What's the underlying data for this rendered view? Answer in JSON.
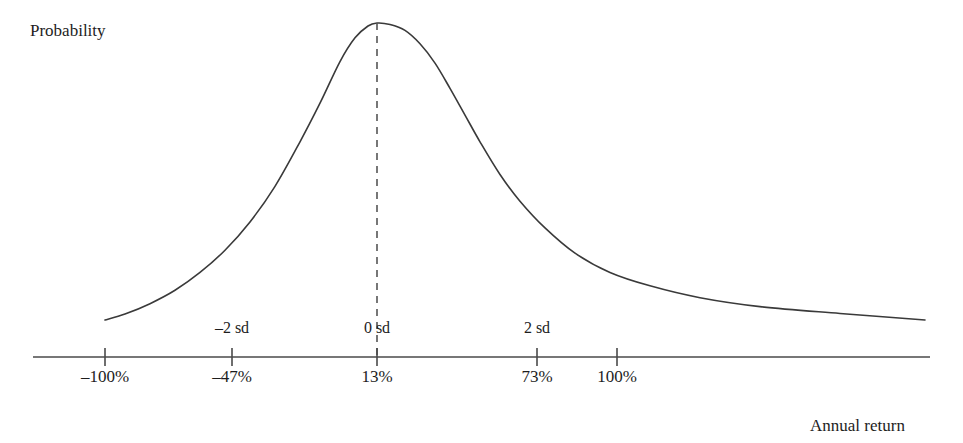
{
  "figure": {
    "width": 963,
    "height": 443,
    "background_color": "#ffffff",
    "stroke_color": "#3a3a3a",
    "axis_color": "#4a4a4a",
    "text_color": "#1d1d1d"
  },
  "axes": {
    "y_axis_label": "Probability",
    "x_axis_label": "Annual return"
  },
  "chart_data": {
    "type": "line",
    "title": "",
    "subtitle": "",
    "xlabel": "Annual return",
    "ylabel": "Probability",
    "grid": false,
    "legend": null,
    "annotations": [
      {
        "name": "mean-dashed-line",
        "style": "dashed-vertical",
        "at_x_percent": 13,
        "at_x_sd": "0 sd",
        "from": "curve-peak",
        "to": "x-axis"
      }
    ],
    "axis_ticks": [
      {
        "sd_label": "",
        "percent_label": "–100%",
        "x_px": 105,
        "sd_value": null,
        "percent_value": -100
      },
      {
        "sd_label": "–2 sd",
        "percent_label": "–47%",
        "x_px": 232,
        "sd_value": -2,
        "percent_value": -47
      },
      {
        "sd_label": "0 sd",
        "percent_label": "13%",
        "x_px": 377,
        "sd_value": 0,
        "percent_value": 13
      },
      {
        "sd_label": "2 sd",
        "percent_label": "73%",
        "x_px": 537,
        "sd_value": 2,
        "percent_value": 73
      },
      {
        "sd_label": "",
        "percent_label": "100%",
        "x_px": 617,
        "sd_value": null,
        "percent_value": 100
      }
    ],
    "x": [
      105,
      125,
      150,
      175,
      200,
      225,
      250,
      275,
      300,
      320,
      340,
      355,
      368,
      377,
      390,
      405,
      420,
      435,
      450,
      465,
      480,
      500,
      520,
      545,
      575,
      610,
      650,
      700,
      760,
      840,
      925
    ],
    "y_probability_normalized": [
      0.0,
      0.02,
      0.055,
      0.1,
      0.16,
      0.235,
      0.33,
      0.45,
      0.6,
      0.73,
      0.87,
      0.95,
      0.99,
      1.0,
      0.995,
      0.975,
      0.93,
      0.865,
      0.78,
      0.69,
      0.6,
      0.49,
      0.4,
      0.31,
      0.225,
      0.16,
      0.115,
      0.075,
      0.045,
      0.022,
      0.0
    ],
    "peak": {
      "x_px": 377,
      "y_px": 23,
      "x_percent": 13,
      "x_sd": 0
    },
    "xlim_px": [
      105,
      925
    ],
    "baseline_y_px": 320,
    "axis_line_y_px": 357
  },
  "geometry": {
    "axis_x_start_px": 33,
    "axis_x_end_px": 930,
    "tick_half_height_px": 9
  }
}
